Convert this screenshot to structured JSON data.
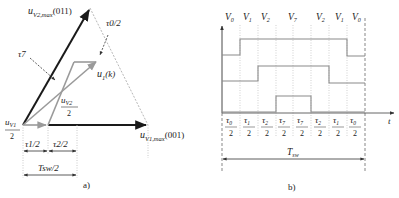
{
  "panel_a": {
    "caption": "a)",
    "vectors": {
      "v2_max": {
        "main": "u",
        "sub": "V2,max",
        "suffix": "(011)"
      },
      "v1_max": {
        "main": "u",
        "sub": "V1,max",
        "suffix": "(001)"
      },
      "u1k": {
        "main": "u",
        "sub": "1",
        "suffix": "(k)"
      },
      "uv1_half": {
        "main": "u",
        "sub": "V1",
        "den": "2"
      },
      "uv2_half": {
        "main": "u",
        "sub": "V2",
        "den": "2"
      }
    },
    "annotations": {
      "tau0_half": "τ0/2",
      "tau7": "τ7",
      "tau1_half": "τ1/2",
      "tau2_half": "τ2/2",
      "tsw_half": "Tsw/2"
    },
    "colors": {
      "primary": "#1a1a1a",
      "secondary": "#9a9a9a",
      "dashed": "#b0b0b0"
    }
  },
  "panel_b": {
    "caption": "b)",
    "states": [
      "V0",
      "V1",
      "V2",
      "V7",
      "V2",
      "V1",
      "V0"
    ],
    "state_labels": [
      {
        "main": "V",
        "sub": "0"
      },
      {
        "main": "V",
        "sub": "1"
      },
      {
        "main": "V",
        "sub": "2"
      },
      {
        "main": "V",
        "sub": "7"
      },
      {
        "main": "V",
        "sub": "2"
      },
      {
        "main": "V",
        "sub": "1"
      },
      {
        "main": "V",
        "sub": "0"
      }
    ],
    "intervals": [
      {
        "num": "τ",
        "sub": "0",
        "den": "2"
      },
      {
        "num": "τ",
        "sub": "1",
        "den": "2"
      },
      {
        "num": "τ",
        "sub": "2",
        "den": "2"
      },
      {
        "num": "τ",
        "sub": "7",
        "den": "2"
      },
      {
        "num": "τ",
        "sub": "7",
        "den": "2"
      },
      {
        "num": "τ",
        "sub": "2",
        "den": "2"
      },
      {
        "num": "τ",
        "sub": "1",
        "den": "2"
      },
      {
        "num": "τ",
        "sub": "0",
        "den": "2"
      }
    ],
    "time_axis_label": "t",
    "period_label": {
      "main": "T",
      "sub": "sw"
    },
    "signals": [
      {
        "name": "phase-a",
        "pattern": [
          0,
          1,
          1,
          1,
          1,
          1,
          1,
          0
        ]
      },
      {
        "name": "phase-b",
        "pattern": [
          0,
          0,
          1,
          1,
          1,
          1,
          0,
          0
        ]
      },
      {
        "name": "phase-c",
        "pattern": [
          0,
          0,
          0,
          1,
          1,
          0,
          0,
          0
        ]
      }
    ]
  }
}
